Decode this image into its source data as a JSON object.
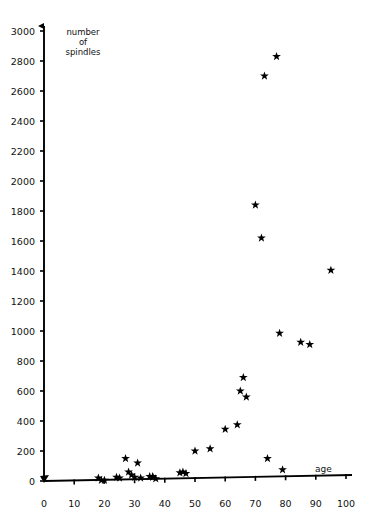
{
  "chart_data": {
    "type": "scatter",
    "title": "",
    "xlabel": "age",
    "ylabel": "number of spindles",
    "ylabel_lines": [
      "number",
      "of",
      "spindles"
    ],
    "xlim": [
      0,
      100
    ],
    "ylim": [
      0,
      3000
    ],
    "xticks": [
      0,
      10,
      20,
      30,
      40,
      50,
      60,
      70,
      80,
      90,
      100
    ],
    "yticks": [
      0,
      200,
      400,
      600,
      800,
      1000,
      1200,
      1400,
      1600,
      1800,
      2000,
      2200,
      2400,
      2600,
      2800,
      3000
    ],
    "xtick_labels": [
      "0",
      "10",
      "20",
      "30",
      "40",
      "50",
      "60",
      "70",
      "80",
      "90",
      "100"
    ],
    "ytick_labels": [
      "0",
      "200",
      "400",
      "600",
      "800",
      "1000",
      "1200",
      "1400",
      "1600",
      "1800",
      "2000",
      "2200",
      "2400",
      "2600",
      "2800",
      "3000"
    ],
    "grid": false,
    "legend": null,
    "marker": "star",
    "marker_color": "#000000",
    "points": [
      {
        "x": 18,
        "y": 20
      },
      {
        "x": 19,
        "y": 5
      },
      {
        "x": 20,
        "y": 5
      },
      {
        "x": 24,
        "y": 25
      },
      {
        "x": 25,
        "y": 20
      },
      {
        "x": 27,
        "y": 150
      },
      {
        "x": 28,
        "y": 60
      },
      {
        "x": 29,
        "y": 40
      },
      {
        "x": 30,
        "y": 25
      },
      {
        "x": 31,
        "y": 120
      },
      {
        "x": 32,
        "y": 20
      },
      {
        "x": 35,
        "y": 30
      },
      {
        "x": 36,
        "y": 30
      },
      {
        "x": 36,
        "y": 25
      },
      {
        "x": 37,
        "y": 15
      },
      {
        "x": 45,
        "y": 55
      },
      {
        "x": 46,
        "y": 60
      },
      {
        "x": 47,
        "y": 50
      },
      {
        "x": 50,
        "y": 200
      },
      {
        "x": 55,
        "y": 215
      },
      {
        "x": 60,
        "y": 345
      },
      {
        "x": 64,
        "y": 375
      },
      {
        "x": 65,
        "y": 600
      },
      {
        "x": 66,
        "y": 690
      },
      {
        "x": 67,
        "y": 560
      },
      {
        "x": 70,
        "y": 1840
      },
      {
        "x": 72,
        "y": 1620
      },
      {
        "x": 73,
        "y": 2700
      },
      {
        "x": 74,
        "y": 150
      },
      {
        "x": 77,
        "y": 2830
      },
      {
        "x": 78,
        "y": 985
      },
      {
        "x": 79,
        "y": 75
      },
      {
        "x": 85,
        "y": 925
      },
      {
        "x": 88,
        "y": 910
      },
      {
        "x": 95,
        "y": 1405
      }
    ]
  }
}
